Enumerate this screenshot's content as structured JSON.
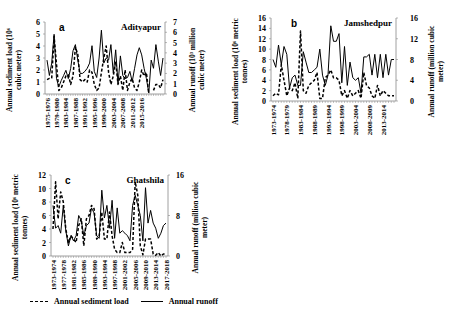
{
  "legend": {
    "sediment_label": "Annual sediment load",
    "runoff_label": "Annual runoff"
  },
  "chart_data": [
    {
      "type": "line",
      "panel": "a",
      "title": "Adityapur",
      "ylabel_left": [
        "Annual sediment load (10⁶",
        "cubic meter)"
      ],
      "ylabel_right": [
        "Annual runoff (10³ million",
        "cubic meter)"
      ],
      "ylim_left": [
        0,
        6
      ],
      "ylim_right": [
        0,
        7
      ],
      "yticks_left": [
        0,
        1,
        2,
        3,
        4,
        5,
        6
      ],
      "yticks_right": [
        0,
        1,
        2,
        3,
        4,
        5,
        6,
        7
      ],
      "x_tick_labels": [
        "1975-1976",
        "1979-1980",
        "1983-1984",
        "1987-1988",
        "1991-1992",
        "1995-1996",
        "1999-2000",
        "2003-2004",
        "2007-2008",
        "2011-2012",
        "2015-2016"
      ],
      "x_start_year": 1975,
      "frame": {
        "x0": 45,
        "x1": 165,
        "y0": 94,
        "y1": 22
      },
      "series": [
        {
          "name": "Annual sediment load",
          "axis": "left",
          "style": "dashed",
          "values": [
            1.2,
            1.3,
            1.3,
            4.8,
            2.5,
            0.3,
            0.5,
            1.0,
            1.5,
            1.6,
            0.8,
            1.5,
            3.9,
            3.3,
            1.2,
            1.0,
            1.2,
            1.0,
            2.0,
            1.8,
            0.8,
            0.3,
            0.5,
            1.8,
            3.0,
            4.0,
            1.8,
            0.8,
            1.5,
            2.7,
            0.8,
            1.5,
            0.3,
            2.0,
            0.3,
            1.0,
            1.3,
            0.5,
            0.3,
            1.0,
            2.0,
            1.5,
            1.8,
            0.0,
            null,
            0.3,
            0.8,
            0.8,
            0.5,
            1.2
          ]
        },
        {
          "name": "Annual runoff",
          "axis": "right",
          "style": "solid",
          "values": [
            3.3,
            1.8,
            3.0,
            5.8,
            1.5,
            0.7,
            1.3,
            1.8,
            2.3,
            1.5,
            2.5,
            4.2,
            4.8,
            3.3,
            2.0,
            2.0,
            2.2,
            2.5,
            3.0,
            4.7,
            2.2,
            1.6,
            3.5,
            6.2,
            3.0,
            3.5,
            3.3,
            4.8,
            2.0,
            4.3,
            1.0,
            3.7,
            1.8,
            1.5,
            1.6,
            2.2,
            1.2,
            2.5,
            3.8,
            4.5,
            3.8,
            2.5,
            1.5,
            0.1,
            3.3,
            2.5,
            4.8,
            3.2,
            1.8,
            3.5
          ]
        }
      ]
    },
    {
      "type": "line",
      "panel": "b",
      "title": "Jamshedpur",
      "ylabel_left": [
        "Annual sediment load (10⁶ metric",
        "tonnes)"
      ],
      "ylabel_right": [
        "Annual runoff (million cubic",
        "meter)"
      ],
      "ylim_left": [
        0,
        16
      ],
      "ylim_right": [
        0,
        16
      ],
      "yticks_left": [
        0,
        2,
        4,
        6,
        8,
        10,
        12,
        14,
        16
      ],
      "yticks_right": [
        0,
        4,
        8,
        12,
        16
      ],
      "x_tick_labels": [
        "1973-1974",
        "1978-1979",
        "1983-1984",
        "1988-1989",
        "1993-1994",
        "1998-1999",
        "2003-2004",
        "2008-2009",
        "2013-2014"
      ],
      "x_start_year": 1973,
      "frame": {
        "x0": 271,
        "x1": 396,
        "y0": 101,
        "y1": 18
      },
      "series": [
        {
          "name": "Annual sediment load",
          "axis": "left",
          "style": "dashed",
          "values": [
            1.0,
            1.5,
            1.2,
            7.0,
            4.0,
            1.0,
            2.5,
            2.0,
            3.5,
            0.5,
            13.5,
            2.0,
            1.5,
            3.0,
            3.5,
            4.0,
            5.5,
            0.5,
            0.5,
            4.5,
            5.0,
            6.0,
            4.5,
            4.5,
            4.0,
            1.0,
            2.0,
            0.5,
            2.0,
            1.0,
            1.5,
            2.0,
            0.5,
            5.5,
            3.0,
            2.5,
            1.0,
            0.5,
            3.0,
            1.0,
            2.0,
            1.5,
            1.0,
            1.0,
            1.0
          ]
        },
        {
          "name": "Annual runoff",
          "axis": "right",
          "style": "solid",
          "values": [
            8.0,
            6.5,
            10.8,
            7.0,
            10.5,
            9.0,
            2.5,
            4.5,
            5.0,
            3.0,
            3.0,
            9.5,
            7.5,
            5.5,
            5.5,
            6.0,
            6.5,
            10.0,
            5.0,
            3.0,
            5.0,
            14.5,
            11.5,
            11.5,
            13.0,
            3.5,
            10.5,
            3.0,
            7.5,
            4.5,
            4.0,
            4.5,
            1.5,
            8.5,
            8.5,
            9.0,
            5.0,
            9.0,
            4.5,
            9.0,
            4.5,
            9.0,
            5.0,
            8.0,
            8.0
          ]
        }
      ]
    },
    {
      "type": "line",
      "panel": "c",
      "title": "Ghatshila",
      "ylabel_left": [
        "Annual sediment load (10⁶ metric",
        "tonnes)"
      ],
      "ylabel_right": [
        "Annual runoff (million cubic",
        "meter)"
      ],
      "ylim_left": [
        0,
        12
      ],
      "ylim_right": [
        0,
        16
      ],
      "yticks_left": [
        0,
        2,
        4,
        6,
        8,
        10,
        12
      ],
      "yticks_right": [
        0,
        8,
        16
      ],
      "x_tick_labels": [
        "1973-1974",
        "1977-1978",
        "1981-1982",
        "1985-1986",
        "1989-1990",
        "1993-1994",
        "1997-1998",
        "2001-2002",
        "2005-2006",
        "2009-2010",
        "2013-2014",
        "2017-2018"
      ],
      "x_start_year": 1973,
      "frame": {
        "x0": 51,
        "x1": 168,
        "y0": 256,
        "y1": 175
      },
      "series": [
        {
          "name": "Annual sediment load",
          "axis": "left",
          "style": "dashed",
          "values": [
            4.0,
            11.0,
            5.5,
            9.5,
            8.0,
            4.0,
            2.0,
            3.0,
            2.5,
            2.0,
            4.5,
            5.5,
            1.5,
            5.5,
            6.0,
            7.5,
            7.0,
            2.5,
            3.0,
            6.5,
            2.5,
            2.5,
            6.5,
            3.0,
            1.0,
            0.5,
            0.5,
            2.0,
            0.5,
            0.5,
            0.5,
            1.0,
            11.0,
            9.0,
            1.5,
            0.2,
            2.5,
            2.5,
            2.5,
            0.3,
            0.1,
            0.5,
            0.0,
            0.3,
            0.3
          ]
        },
        {
          "name": "Annual runoff",
          "axis": "right",
          "style": "solid",
          "values": [
            10.0,
            5.5,
            6.0,
            4.5,
            10.0,
            5.0,
            2.0,
            4.0,
            3.0,
            4.0,
            8.0,
            7.0,
            4.0,
            6.0,
            6.5,
            9.5,
            8.5,
            4.0,
            3.5,
            13.0,
            7.5,
            10.0,
            5.5,
            11.0,
            3.5,
            9.5,
            4.5,
            5.0,
            4.5,
            4.0,
            3.0,
            10.0,
            12.0,
            10.0,
            8.0,
            3.0,
            13.5,
            6.5,
            9.0,
            6.5,
            5.5,
            3.5,
            4.5,
            6.0,
            6.5
          ]
        }
      ]
    }
  ]
}
